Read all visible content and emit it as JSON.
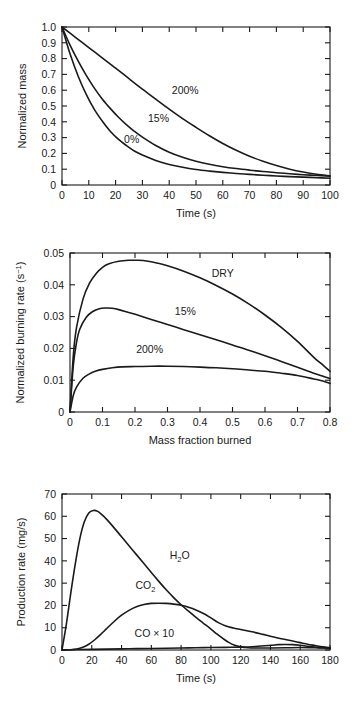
{
  "figure": {
    "background": "#ffffff",
    "ink": "#1a1a1a"
  },
  "chart_data": [
    {
      "id": "panel-a",
      "type": "line",
      "title": "",
      "xlabel": "Time (s)",
      "ylabel": "Normalized mass",
      "xlim": [
        0,
        100
      ],
      "ylim": [
        0,
        1.0
      ],
      "xticks": [
        0,
        10,
        20,
        30,
        40,
        50,
        60,
        70,
        80,
        90,
        100
      ],
      "xticklabels": [
        "0",
        "10",
        "20",
        "30",
        "40",
        "50",
        "60",
        "70",
        "80",
        "90",
        "100"
      ],
      "yticks": [
        0,
        0.1,
        0.2,
        0.3,
        0.4,
        0.5,
        0.6,
        0.7,
        0.8,
        0.9,
        1.0
      ],
      "yticklabels": [
        "0",
        "0.1",
        "0.2",
        "0.3",
        "0.4",
        "0.5",
        "0.6",
        "0.7",
        "0.8",
        "0.9",
        "1.0"
      ],
      "grid": false,
      "legend": "inline-annotations",
      "series": [
        {
          "name": "0%",
          "label": "0%",
          "label_x": 26,
          "label_y": 0.265,
          "x": [
            0,
            3,
            6,
            9,
            12,
            15,
            18,
            21,
            24,
            27,
            30,
            35,
            40,
            45,
            50,
            55,
            60,
            65,
            70,
            75,
            80,
            85,
            90,
            95,
            100
          ],
          "y": [
            1.0,
            0.83,
            0.69,
            0.575,
            0.48,
            0.405,
            0.34,
            0.29,
            0.25,
            0.215,
            0.19,
            0.155,
            0.13,
            0.112,
            0.098,
            0.088,
            0.08,
            0.073,
            0.067,
            0.062,
            0.057,
            0.053,
            0.05,
            0.046,
            0.043
          ]
        },
        {
          "name": "15%",
          "label": "15%",
          "label_x": 36,
          "label_y": 0.4,
          "x": [
            0,
            3,
            6,
            9,
            12,
            15,
            18,
            21,
            24,
            27,
            30,
            35,
            40,
            45,
            50,
            55,
            60,
            65,
            70,
            75,
            80,
            85,
            90,
            95,
            100
          ],
          "y": [
            1.0,
            0.885,
            0.785,
            0.695,
            0.615,
            0.545,
            0.485,
            0.43,
            0.382,
            0.34,
            0.303,
            0.25,
            0.207,
            0.175,
            0.15,
            0.131,
            0.116,
            0.104,
            0.094,
            0.085,
            0.078,
            0.071,
            0.065,
            0.06,
            0.055
          ]
        },
        {
          "name": "200%",
          "label": "200%",
          "label_x": 46,
          "label_y": 0.575,
          "x": [
            0,
            5,
            10,
            15,
            20,
            25,
            30,
            35,
            40,
            45,
            50,
            55,
            60,
            65,
            70,
            75,
            80,
            85,
            90,
            95,
            100
          ],
          "y": [
            1.0,
            0.935,
            0.87,
            0.805,
            0.74,
            0.673,
            0.607,
            0.543,
            0.48,
            0.42,
            0.365,
            0.312,
            0.263,
            0.22,
            0.182,
            0.15,
            0.123,
            0.1,
            0.082,
            0.068,
            0.058
          ]
        }
      ]
    },
    {
      "id": "panel-b",
      "type": "line",
      "title": "",
      "xlabel": "Mass fraction burned",
      "ylabel": "Normalized burning rate (s⁻¹)",
      "ylabel_parts": {
        "text": "Normalized burning rate (s",
        "sup": "−1",
        "tail": ")"
      },
      "xlim": [
        0,
        0.8
      ],
      "ylim": [
        0,
        0.05
      ],
      "xticks": [
        0,
        0.1,
        0.2,
        0.3,
        0.4,
        0.5,
        0.6,
        0.7,
        0.8
      ],
      "xticklabels": [
        "0",
        "0.1",
        "0.2",
        "0.3",
        "0.4",
        "0.5",
        "0.6",
        "0.7",
        "0.8"
      ],
      "yticks": [
        0,
        0.01,
        0.02,
        0.03,
        0.04,
        0.05
      ],
      "yticklabels": [
        "0",
        "0.01",
        "0.02",
        "0.03",
        "0.04",
        "0.05"
      ],
      "grid": false,
      "legend": "inline-annotations",
      "series": [
        {
          "name": "DRY",
          "label": "DRY",
          "label_x": 0.47,
          "label_y": 0.0425,
          "x": [
            0,
            0.01,
            0.02,
            0.04,
            0.06,
            0.08,
            0.1,
            0.12,
            0.15,
            0.18,
            0.21,
            0.24,
            0.27,
            0.3,
            0.35,
            0.4,
            0.45,
            0.5,
            0.55,
            0.6,
            0.65,
            0.7,
            0.75,
            0.78,
            0.8
          ],
          "y": [
            0.0,
            0.0175,
            0.0265,
            0.0355,
            0.0405,
            0.0435,
            0.0455,
            0.0466,
            0.0474,
            0.0477,
            0.0477,
            0.0474,
            0.0468,
            0.046,
            0.0443,
            0.0422,
            0.0398,
            0.0371,
            0.034,
            0.0305,
            0.0266,
            0.0222,
            0.0172,
            0.0146,
            0.0128
          ]
        },
        {
          "name": "15%",
          "label": "15%",
          "label_x": 0.355,
          "label_y": 0.0305,
          "x": [
            0,
            0.01,
            0.02,
            0.03,
            0.05,
            0.07,
            0.09,
            0.11,
            0.13,
            0.15,
            0.18,
            0.21,
            0.25,
            0.3,
            0.35,
            0.4,
            0.45,
            0.5,
            0.55,
            0.6,
            0.65,
            0.7,
            0.75,
            0.78,
            0.8
          ],
          "y": [
            0.0,
            0.0145,
            0.0218,
            0.026,
            0.0298,
            0.0316,
            0.0325,
            0.0327,
            0.0326,
            0.0322,
            0.0313,
            0.0304,
            0.0291,
            0.0275,
            0.0259,
            0.0243,
            0.0227,
            0.0211,
            0.0194,
            0.0177,
            0.0159,
            0.0141,
            0.0122,
            0.0112,
            0.0105
          ]
        },
        {
          "name": "200%",
          "label": "200%",
          "label_x": 0.245,
          "label_y": 0.0185,
          "x": [
            0,
            0.01,
            0.02,
            0.04,
            0.06,
            0.08,
            0.1,
            0.13,
            0.16,
            0.2,
            0.25,
            0.3,
            0.35,
            0.4,
            0.45,
            0.5,
            0.55,
            0.6,
            0.65,
            0.7,
            0.75,
            0.78,
            0.8
          ],
          "y": [
            0.0,
            0.0052,
            0.0078,
            0.0106,
            0.012,
            0.0129,
            0.0134,
            0.0139,
            0.0142,
            0.0143,
            0.0144,
            0.0144,
            0.0143,
            0.0141,
            0.0139,
            0.0136,
            0.0132,
            0.0128,
            0.0122,
            0.0115,
            0.0104,
            0.0097,
            0.009
          ]
        }
      ]
    },
    {
      "id": "panel-c",
      "type": "line",
      "title": "",
      "xlabel": "Time (s)",
      "ylabel": "Production rate (mg/s)",
      "xlim": [
        0,
        180
      ],
      "ylim": [
        0,
        70
      ],
      "xticks": [
        0,
        20,
        40,
        60,
        80,
        100,
        120,
        140,
        160,
        180
      ],
      "xticklabels": [
        "0",
        "20",
        "40",
        "60",
        "80",
        "100",
        "120",
        "140",
        "160",
        "180"
      ],
      "yticks": [
        0,
        10,
        20,
        30,
        40,
        50,
        60,
        70
      ],
      "yticklabels": [
        "0",
        "10",
        "20",
        "30",
        "40",
        "50",
        "60",
        "70"
      ],
      "grid": false,
      "legend": "inline-annotations",
      "series": [
        {
          "name": "H2O",
          "label": "H₂O",
          "label_parts": {
            "pre": "H",
            "sub": "2",
            "post": "O"
          },
          "label_x": 79,
          "label_y": 41,
          "x": [
            0,
            3,
            6,
            9,
            12,
            15,
            18,
            21,
            24,
            27,
            30,
            35,
            40,
            45,
            50,
            55,
            60,
            65,
            70,
            75,
            80,
            85,
            90,
            95,
            100,
            104,
            108,
            112,
            116,
            120,
            125,
            130,
            140,
            150,
            160,
            170,
            180
          ],
          "y": [
            0,
            12,
            26,
            39,
            50,
            57.5,
            61.5,
            62.6,
            62.2,
            60.6,
            58.6,
            54.8,
            50.8,
            46.8,
            42.8,
            38.8,
            34.8,
            30.8,
            27.0,
            23.5,
            20.3,
            17.4,
            14.6,
            12.0,
            9.4,
            7.2,
            5.2,
            3.4,
            2.1,
            1.4,
            1.0,
            0.9,
            0.9,
            1.0,
            1.1,
            1.0,
            0.9
          ]
        },
        {
          "name": "CO2",
          "label": "CO₂",
          "label_parts": {
            "pre": "CO",
            "sub": "2",
            "post": ""
          },
          "label_x": 56,
          "label_y": 27.5,
          "x": [
            0,
            5,
            10,
            14,
            18,
            22,
            26,
            30,
            35,
            40,
            45,
            50,
            55,
            60,
            65,
            70,
            75,
            80,
            85,
            90,
            95,
            100,
            105,
            110,
            115,
            120,
            125,
            130,
            135,
            140,
            145,
            150,
            155,
            160,
            165,
            170,
            175,
            180
          ],
          "y": [
            0,
            0.1,
            0.4,
            1.2,
            2.6,
            4.6,
            7.0,
            9.6,
            12.8,
            15.6,
            17.8,
            19.4,
            20.4,
            20.9,
            21.0,
            20.9,
            20.6,
            20.1,
            19.2,
            18.0,
            16.4,
            14.4,
            12.3,
            10.8,
            9.9,
            9.2,
            8.5,
            7.8,
            7.0,
            6.2,
            5.4,
            4.7,
            4.0,
            3.3,
            2.6,
            2.0,
            1.4,
            1.0
          ]
        },
        {
          "name": "CO x 10",
          "label": "CO × 10",
          "label_x": 62,
          "label_y": 5.8,
          "x": [
            0,
            10,
            20,
            30,
            40,
            50,
            60,
            70,
            80,
            90,
            100,
            110,
            120,
            130,
            140,
            145,
            150,
            155,
            160,
            165,
            170,
            175,
            180
          ],
          "y": [
            0,
            0.2,
            0.3,
            0.4,
            0.5,
            0.6,
            0.7,
            0.8,
            0.9,
            1.0,
            1.1,
            1.2,
            1.3,
            1.6,
            2.1,
            2.4,
            2.5,
            2.4,
            2.1,
            1.7,
            1.3,
            1.0,
            0.8
          ]
        }
      ]
    }
  ]
}
